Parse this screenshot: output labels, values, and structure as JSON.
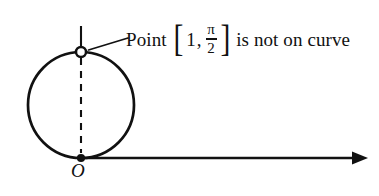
{
  "figure": {
    "type": "polar-curve-diagram",
    "background_color": "#ffffff",
    "ink_color": "#111111",
    "annotation": {
      "prefix_label": "Point",
      "bracket_open": "[",
      "coordinate_r": "1",
      "separator": ",",
      "coordinate_theta_numerator": "π",
      "coordinate_theta_denominator": "2",
      "bracket_close": "]",
      "suffix_label": "is not on curve"
    },
    "origin": {
      "label": "O",
      "x": 81,
      "y": 158,
      "marker": "filled-dot"
    },
    "excluded_point": {
      "x": 81,
      "y": 52,
      "marker": "open-dot"
    },
    "circle": {
      "center_x": 81,
      "center_y": 105,
      "radius": 53,
      "stroke_width": 2.6
    },
    "dashed_diameter": {
      "x": 81,
      "y_top": 58,
      "y_bottom": 153,
      "style": "dashed"
    },
    "vertical_stub": {
      "x": 81,
      "y_top": 26,
      "y_bottom": 46
    },
    "polar_axis": {
      "x_start": 81,
      "x_end": 367,
      "y": 158,
      "arrowhead": "right-solid-triangle"
    },
    "leader_line": {
      "x_start": 88,
      "y_start": 50,
      "x_end": 128,
      "y_end": 38
    }
  }
}
